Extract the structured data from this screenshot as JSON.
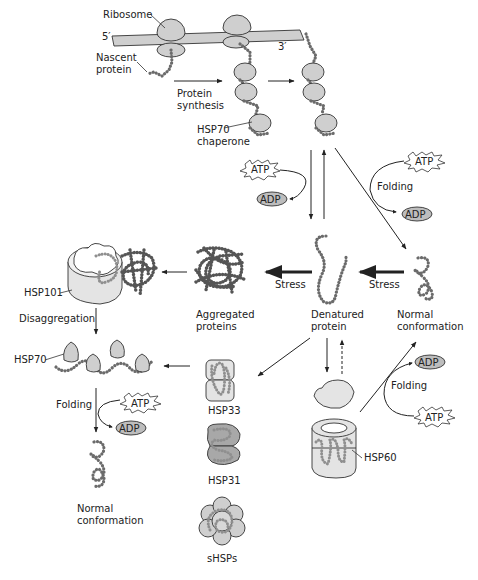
{
  "figure": {
    "colors": {
      "fill_gray": "#cfcfcf",
      "fill_light": "#e4e4e4",
      "fill_mid": "#a8a8a8",
      "chain": "#6b6b6b",
      "line": "#222222"
    }
  },
  "labels": {
    "ribosome": "Ribosome",
    "five_prime": "5′",
    "three_prime": "3′",
    "nascent_line1": "Nascent",
    "nascent_line2": "protein",
    "synthesis_line1": "Protein",
    "synthesis_line2": "synthesis",
    "hsp70_chaperone_line1": "HSP70",
    "hsp70_chaperone_line2": "chaperone",
    "atp": "ATP",
    "adp": "ADP",
    "folding": "Folding",
    "stress": "Stress",
    "aggregated_line1": "Aggregated",
    "aggregated_line2": "proteins",
    "denatured_line1": "Denatured",
    "denatured_line2": "protein",
    "normal_line1": "Normal",
    "normal_line2": "conformation",
    "hsp101": "HSP101",
    "disaggregation": "Disaggregation",
    "hsp70": "HSP70",
    "hsp33": "HSP33",
    "hsp31": "HSP31",
    "shsps": "sHSPs",
    "hsp60": "HSP60"
  },
  "nodes": [
    {
      "id": "ribosome",
      "label": "Ribosome"
    },
    {
      "id": "nascent-protein",
      "label": "Nascent protein"
    },
    {
      "id": "hsp70-chaperone",
      "label": "HSP70 chaperone"
    },
    {
      "id": "denatured-protein",
      "label": "Denatured protein"
    },
    {
      "id": "aggregated-proteins",
      "label": "Aggregated proteins"
    },
    {
      "id": "normal-conformation-right",
      "label": "Normal conformation"
    },
    {
      "id": "hsp101",
      "label": "HSP101"
    },
    {
      "id": "hsp70-disaggregation",
      "label": "HSP70"
    },
    {
      "id": "normal-conformation-left",
      "label": "Normal conformation"
    },
    {
      "id": "hsp33",
      "label": "HSP33"
    },
    {
      "id": "hsp31",
      "label": "HSP31"
    },
    {
      "id": "shsps",
      "label": "sHSPs"
    },
    {
      "id": "hsp60",
      "label": "HSP60"
    }
  ],
  "edges": [
    {
      "from": "ribosome",
      "to": "hsp70-chaperone",
      "label": "Protein synthesis"
    },
    {
      "from": "hsp70-chaperone",
      "to": "released-chain",
      "label": ""
    },
    {
      "from": "hsp70-chaperone",
      "to": "denatured-protein",
      "label": "ATP → ADP"
    },
    {
      "from": "denatured-protein",
      "to": "hsp70-chaperone",
      "label": ""
    },
    {
      "from": "hsp70-chaperone",
      "to": "normal-conformation-right",
      "label": "Folding (ATP → ADP)"
    },
    {
      "from": "normal-conformation-right",
      "to": "denatured-protein",
      "label": "Stress"
    },
    {
      "from": "denatured-protein",
      "to": "aggregated-proteins",
      "label": "Stress"
    },
    {
      "from": "aggregated-proteins",
      "to": "hsp101",
      "label": ""
    },
    {
      "from": "hsp101",
      "to": "hsp70-disaggregation",
      "label": "Disaggregation"
    },
    {
      "from": "hsp33",
      "to": "hsp70-disaggregation",
      "label": ""
    },
    {
      "from": "hsp70-disaggregation",
      "to": "normal-conformation-left",
      "label": "Folding (ATP → ADP)"
    },
    {
      "from": "denatured-protein",
      "to": "hsp33",
      "label": ""
    },
    {
      "from": "denatured-protein",
      "to": "hsp60",
      "label": ""
    },
    {
      "from": "hsp60",
      "to": "denatured-protein",
      "label": "(dashed)"
    },
    {
      "from": "hsp60",
      "to": "normal-conformation-right",
      "label": "Folding (ATP → ADP)"
    }
  ]
}
